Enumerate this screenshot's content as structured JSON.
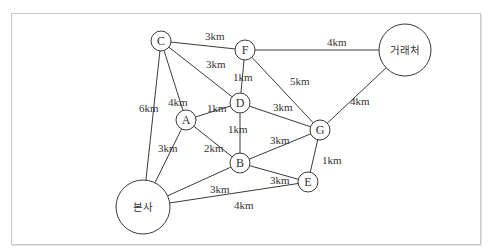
{
  "diagram": {
    "type": "weighted-graph",
    "nodes": [
      {
        "id": "C",
        "label": "C",
        "x": 161,
        "y": 41,
        "r": 10
      },
      {
        "id": "F",
        "label": "F",
        "x": 245,
        "y": 50,
        "r": 10
      },
      {
        "id": "client",
        "label": "거래처",
        "x": 405,
        "y": 50,
        "r": 26
      },
      {
        "id": "D",
        "label": "D",
        "x": 240,
        "y": 103,
        "r": 10
      },
      {
        "id": "A",
        "label": "A",
        "x": 186,
        "y": 120,
        "r": 10
      },
      {
        "id": "G",
        "label": "G",
        "x": 320,
        "y": 130,
        "r": 10
      },
      {
        "id": "B",
        "label": "B",
        "x": 240,
        "y": 163,
        "r": 10
      },
      {
        "id": "E",
        "label": "E",
        "x": 308,
        "y": 182,
        "r": 10
      },
      {
        "id": "hq",
        "label": "본사",
        "x": 143,
        "y": 207,
        "r": 27
      }
    ],
    "edges": [
      {
        "from": "C",
        "to": "F",
        "label": "3km",
        "lx": 205,
        "ly": 40
      },
      {
        "from": "F",
        "to": "client",
        "label": "4km",
        "lx": 327,
        "ly": 46
      },
      {
        "from": "C",
        "to": "D",
        "label": "3km",
        "lx": 206,
        "ly": 68
      },
      {
        "from": "F",
        "to": "D",
        "label": "1km",
        "lx": 233,
        "ly": 81
      },
      {
        "from": "F",
        "to": "G",
        "label": "5km",
        "lx": 290,
        "ly": 85
      },
      {
        "from": "C",
        "to": "A",
        "label": "4km",
        "lx": 168,
        "ly": 106
      },
      {
        "from": "C",
        "to": "hq",
        "label": "6km",
        "lx": 139,
        "ly": 112
      },
      {
        "from": "A",
        "to": "D",
        "label": "1km",
        "lx": 207,
        "ly": 112
      },
      {
        "from": "D",
        "to": "G",
        "label": "3km",
        "lx": 273,
        "ly": 111
      },
      {
        "from": "client",
        "to": "G",
        "label": "4km",
        "lx": 350,
        "ly": 105
      },
      {
        "from": "D",
        "to": "B",
        "label": "1km",
        "lx": 228,
        "ly": 133
      },
      {
        "from": "A",
        "to": "hq",
        "label": "3km",
        "lx": 158,
        "ly": 152
      },
      {
        "from": "A",
        "to": "B",
        "label": "2km",
        "lx": 204,
        "ly": 152
      },
      {
        "from": "B",
        "to": "G",
        "label": "3km",
        "lx": 270,
        "ly": 144
      },
      {
        "from": "G",
        "to": "E",
        "label": "1km",
        "lx": 322,
        "ly": 164
      },
      {
        "from": "B",
        "to": "hq",
        "label": "3km",
        "lx": 210,
        "ly": 193
      },
      {
        "from": "B",
        "to": "E",
        "label": "3km",
        "lx": 270,
        "ly": 184
      },
      {
        "from": "hq",
        "to": "E",
        "label": "4km",
        "lx": 234,
        "ly": 209
      }
    ]
  }
}
